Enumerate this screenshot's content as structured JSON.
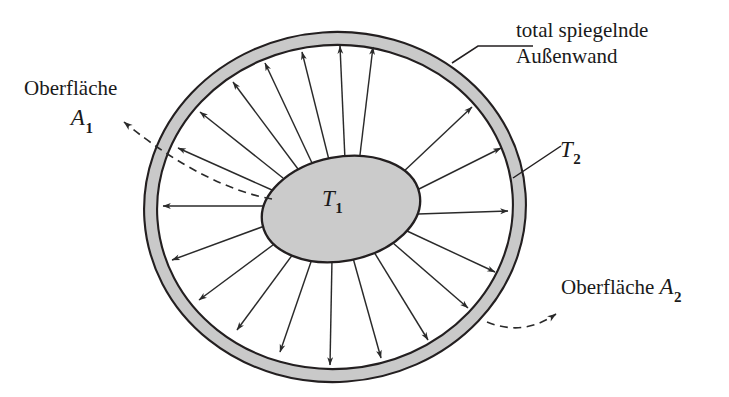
{
  "figure": {
    "labels": {
      "outer_wall_line1": "total spiegelnde",
      "outer_wall_line2": "Außenwand",
      "surface_a1_word": "Oberfläche",
      "surface_a1_symbol": "A",
      "surface_a1_subscript": "1",
      "surface_a2_word": "Oberfläche",
      "surface_a2_symbol": "A",
      "surface_a2_subscript": "2",
      "temperature_inner_symbol": "T",
      "temperature_inner_subscript": "1",
      "temperature_outer_symbol": "T",
      "temperature_outer_subscript": "2"
    },
    "colors": {
      "shell_fill": "#c9c9c9",
      "inner_body_fill": "#cbcbcb",
      "outline": "#231f20",
      "arrow": "#2a2a2a",
      "background": "#ffffff",
      "text": "#1a1a1a"
    },
    "geometry": {
      "outer_shell_outer": {
        "cx": 335,
        "cy": 207,
        "rx": 191,
        "ry": 175,
        "rotation_deg": -4
      },
      "outer_shell_inner": {
        "cx": 335,
        "cy": 207,
        "rx": 178,
        "ry": 162,
        "rotation_deg": -4
      },
      "inner_body": {
        "cx": 341,
        "cy": 209,
        "rx": 80,
        "ry": 52,
        "rotation_deg": -11
      },
      "ray_count": 20
    }
  }
}
